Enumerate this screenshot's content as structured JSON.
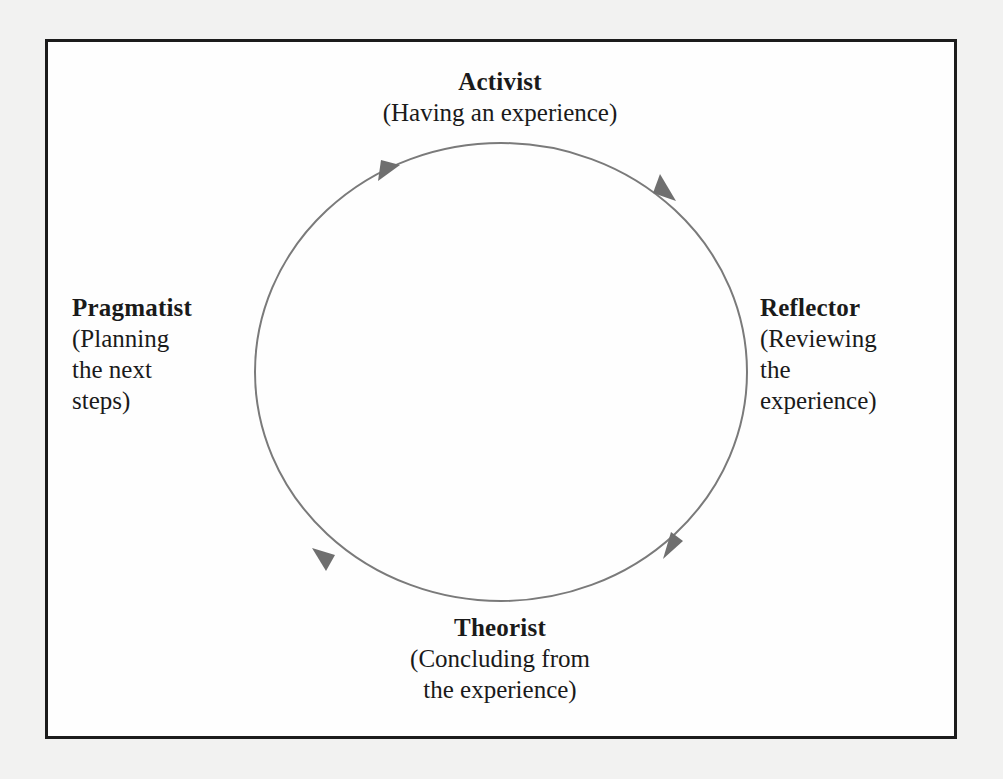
{
  "diagram": {
    "type": "cycle",
    "colors": {
      "frame_border": "#1c1c1c",
      "circle_stroke": "#7a7a7a",
      "arrow_fill": "#6f6f6f",
      "text": "#1a1a1a",
      "background": "#fefefe"
    },
    "stages": [
      {
        "id": "activist",
        "title": "Activist",
        "description": "(Having an experience)",
        "position": "top"
      },
      {
        "id": "reflector",
        "title": "Reflector",
        "description_lines": [
          "(Reviewing",
          "the",
          "experience)"
        ],
        "position": "right"
      },
      {
        "id": "theorist",
        "title": "Theorist",
        "description_lines": [
          "(Concluding from",
          "the experience)"
        ],
        "position": "bottom"
      },
      {
        "id": "pragmatist",
        "title": "Pragmatist",
        "description_lines": [
          "(Planning",
          "the next",
          "steps)"
        ],
        "position": "left"
      }
    ],
    "arrows": [
      {
        "location": "upper-left",
        "direction": "clockwise"
      },
      {
        "location": "upper-right",
        "direction": "clockwise"
      },
      {
        "location": "lower-right",
        "direction": "counter-clockwise"
      },
      {
        "location": "lower-left",
        "direction": "clockwise"
      }
    ]
  }
}
